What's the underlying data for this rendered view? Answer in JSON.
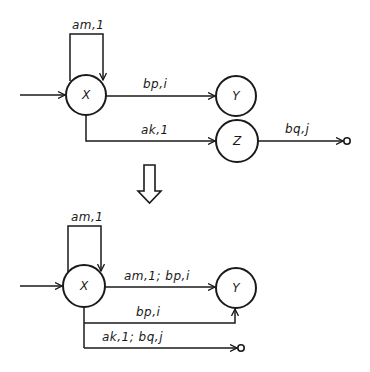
{
  "top_diagram": {
    "nodes": [
      {
        "id": "X",
        "label": "X"
      },
      {
        "id": "Y",
        "label": "Y"
      },
      {
        "id": "Z",
        "label": "Z"
      }
    ],
    "edges": [
      {
        "from": "input",
        "to": "X",
        "label": ""
      },
      {
        "from": "X",
        "to": "X",
        "label": "am,1"
      },
      {
        "from": "X",
        "to": "Y",
        "label": "bp,i"
      },
      {
        "from": "X",
        "to": "Z",
        "label": "ak,1"
      },
      {
        "from": "Z",
        "to": "output",
        "label": "bq,j"
      }
    ]
  },
  "transform_arrow": {
    "icon": "hollow-down-arrow-icon"
  },
  "bottom_diagram": {
    "nodes": [
      {
        "id": "X",
        "label": "X"
      },
      {
        "id": "Y",
        "label": "Y"
      }
    ],
    "edges": [
      {
        "from": "input",
        "to": "X",
        "label": ""
      },
      {
        "from": "X",
        "to": "X",
        "label": "am,1"
      },
      {
        "from": "X",
        "to": "Y",
        "label": "am,1; bp,i"
      },
      {
        "from": "X",
        "to": "Y",
        "label": "bp,i"
      },
      {
        "from": "X",
        "to": "output",
        "label": "ak,1; bq,j"
      }
    ]
  }
}
